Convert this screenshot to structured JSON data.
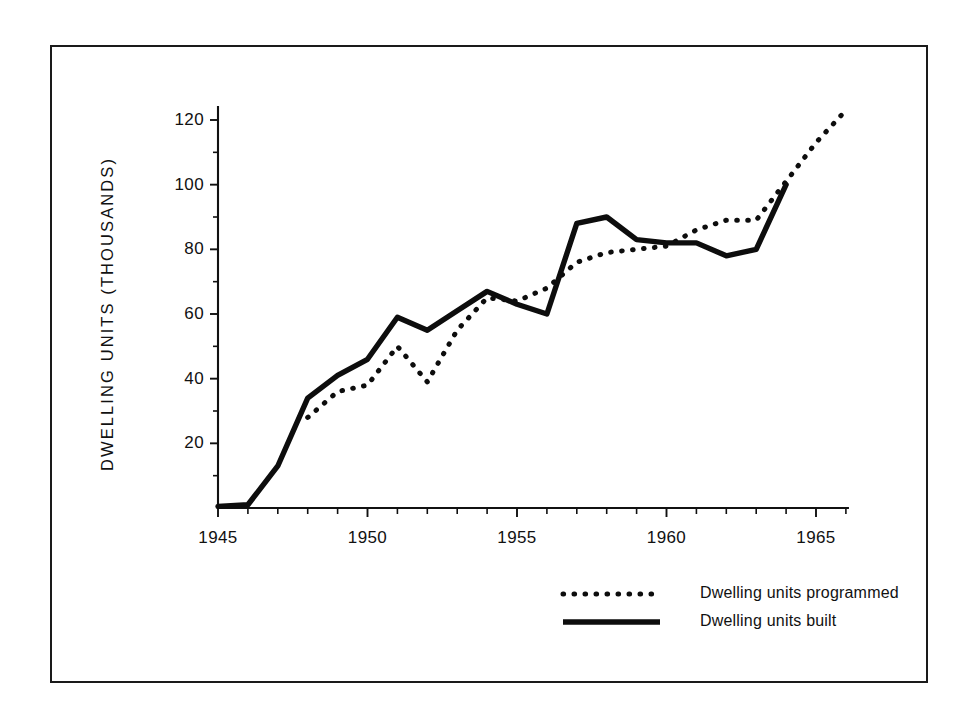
{
  "chart_data": {
    "type": "line",
    "title": "",
    "xlabel": "",
    "ylabel": "DWELLING  UNITS  (THOUSANDS)",
    "xlim": [
      1945,
      1966
    ],
    "ylim": [
      0,
      124
    ],
    "grid": false,
    "legend_position": "bottom-right",
    "x_tick_labels": [
      "1945",
      "1950",
      "1955",
      "1960",
      "1965"
    ],
    "x_tick_values": [
      1945,
      1950,
      1955,
      1960,
      1965
    ],
    "x_minor_tick_values": [
      1946,
      1947,
      1948,
      1949,
      1951,
      1952,
      1953,
      1954,
      1956,
      1957,
      1958,
      1959,
      1961,
      1962,
      1963,
      1964,
      1966
    ],
    "y_tick_labels": [
      "20",
      "40",
      "60",
      "80",
      "100",
      "120"
    ],
    "y_tick_values": [
      20,
      40,
      60,
      80,
      100,
      120
    ],
    "y_minor_tick_values": [
      10,
      30,
      50,
      70,
      90,
      110
    ],
    "series": [
      {
        "name": "Dwelling units programmed",
        "style": "dotted",
        "color": "#0d0d0d",
        "x": [
          1948,
          1949,
          1950,
          1951,
          1952,
          1953,
          1954,
          1955,
          1956,
          1957,
          1958,
          1959,
          1960,
          1961,
          1962,
          1963,
          1964,
          1965,
          1966
        ],
        "values": [
          28,
          36,
          38,
          50,
          39,
          55,
          65,
          64,
          68,
          76,
          79,
          80,
          81,
          86,
          89,
          89,
          101,
          113,
          123
        ]
      },
      {
        "name": "Dwelling units built",
        "style": "solid",
        "color": "#0d0d0d",
        "x": [
          1945,
          1946,
          1947,
          1948,
          1949,
          1950,
          1951,
          1952,
          1953,
          1954,
          1955,
          1956,
          1957,
          1958,
          1959,
          1960,
          1961,
          1962,
          1963,
          1964
        ],
        "values": [
          0.5,
          1,
          13,
          34,
          41,
          46,
          59,
          55,
          61,
          67,
          63,
          60,
          88,
          90,
          83,
          82,
          82,
          78,
          80,
          100
        ]
      }
    ]
  },
  "legend": {
    "entries": [
      {
        "label": "Dwelling units programmed",
        "style": "dotted"
      },
      {
        "label": "Dwelling units built",
        "style": "solid"
      }
    ]
  }
}
